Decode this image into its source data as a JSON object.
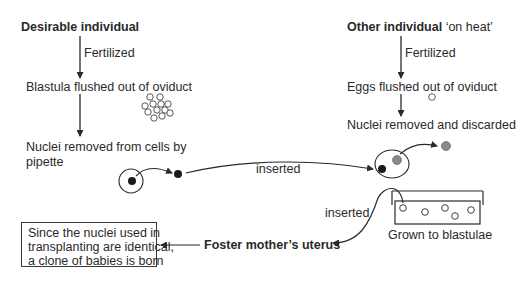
{
  "left_column": {
    "title": "Desirable individual",
    "step1_label": "Fertilized",
    "step2": "Blastula flushed out of oviduct",
    "step3_line1": "Nuclei removed from cells by",
    "step3_line2": "pipette"
  },
  "right_column": {
    "title_bold": "Other individual",
    "title_rest": "‘on heat’",
    "step1_label": "Fertilized",
    "step2": "Eggs flushed out of oviduct",
    "step3": "Nuclei removed and discarded"
  },
  "transfer": {
    "inserted_label_1": "inserted",
    "inserted_label_2": "inserted",
    "dish_label": "Grown to blastulae"
  },
  "outcome": {
    "uterus_label": "Foster mother’s uterus",
    "conclusion_line1": "Since the nuclei used in",
    "conclusion_line2": "transplanting are identical,",
    "conclusion_line3": "a clone of babies is born"
  },
  "colors": {
    "line": "#2a2a2a",
    "nucleus_donor": "#1a1a1a",
    "nucleus_discarded": "#8a8a8a"
  }
}
